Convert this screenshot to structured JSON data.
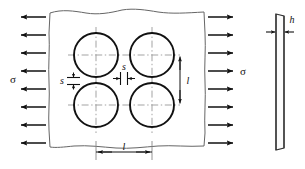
{
  "figure": {
    "background_color": "#ffffff",
    "line_color": "#111111",
    "plate_outline_color": "#555555",
    "centerline_color": "#888888"
  },
  "labels": {
    "stress_left": "σ",
    "stress_right": "σ",
    "pitch_horizontal": "l",
    "pitch_vertical": "l",
    "ligament_vertical": "s",
    "ligament_horizontal": "s",
    "thickness": "h"
  },
  "load": {
    "arrow_count_left": 8,
    "arrow_count_right": 8,
    "direction_left": "left",
    "direction_right": "right"
  },
  "holes": {
    "rows": 2,
    "columns": 2,
    "count": 4,
    "radius_px": 22
  },
  "side_view": {
    "shape": "thin-vertical-plate",
    "thickness_label": "h"
  }
}
